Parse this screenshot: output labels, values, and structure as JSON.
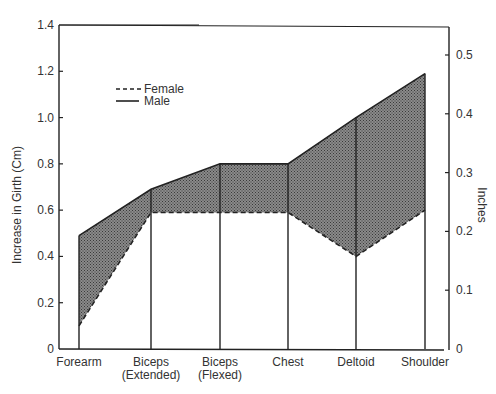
{
  "chart_data": {
    "type": "line",
    "title": "",
    "xlabel": "",
    "ylabel": "Increase in Girth (Cm)",
    "ylabel_right": "Inches",
    "categories": [
      "Forearm",
      "Biceps (Extended)",
      "Biceps (Flexed)",
      "Chest",
      "Deltoid",
      "Shoulder"
    ],
    "category_lines": [
      [
        "Forearm"
      ],
      [
        "Biceps",
        "(Extended)"
      ],
      [
        "Biceps",
        "(Flexed)"
      ],
      [
        "Chest"
      ],
      [
        "Deltoid"
      ],
      [
        "Shoulder"
      ]
    ],
    "series": [
      {
        "name": "Female",
        "style": "dashed",
        "values": [
          0.1,
          0.59,
          0.59,
          0.59,
          0.4,
          0.6
        ]
      },
      {
        "name": "Male",
        "style": "solid",
        "values": [
          0.49,
          0.69,
          0.8,
          0.8,
          1.0,
          1.19
        ]
      }
    ],
    "ylim": [
      0,
      1.4
    ],
    "yticks": [
      0,
      0.2,
      0.4,
      0.6,
      0.8,
      1.0,
      1.2,
      1.4
    ],
    "ytick_labels": [
      "0",
      "0.2",
      "0.4",
      "0.6",
      "0.8",
      "1.0",
      "1.2",
      "1.4"
    ],
    "ylim_right": [
      0,
      0.551
    ],
    "yticks_right": [
      0,
      0.1,
      0.2,
      0.3,
      0.4,
      0.5
    ],
    "ytick_labels_right": [
      "0",
      "0.1",
      "0.2",
      "0.3",
      "0.4",
      "0.5"
    ],
    "legend": {
      "position": "upper-left",
      "entries": [
        "Female",
        "Male"
      ]
    },
    "fill_between": "shaded hatch region between Male and Female series",
    "grid": false
  },
  "colors": {
    "axis": "#222222",
    "fill": "#6a6a6a",
    "text": "#333333"
  }
}
